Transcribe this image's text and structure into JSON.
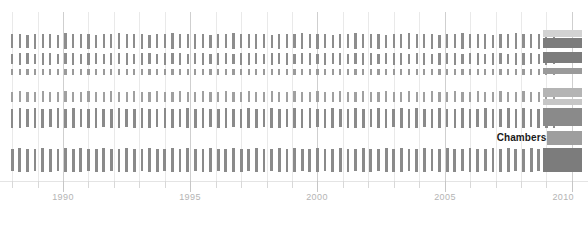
{
  "chart_data": {
    "type": "bar",
    "title": "",
    "subtitle": "",
    "xlabel": "",
    "ylabel": "",
    "xlim": [
      1987.6,
      2010.4
    ],
    "grid": true,
    "legend_position": "none",
    "x_ticks_major": [
      1990,
      1995,
      2000,
      2005,
      2010
    ],
    "x_tick_labels": [
      "1990",
      "1995",
      "2000",
      "2005",
      "2010"
    ],
    "x_ticks_minor": [
      1988,
      1989,
      1991,
      1992,
      1993,
      1994,
      1996,
      1997,
      1998,
      1999,
      2001,
      2002,
      2003,
      2004,
      2006,
      2007,
      2008,
      2009
    ],
    "annotations": [
      {
        "text": "Chambers",
        "x": 2009.0,
        "y_row": "spacer-3",
        "align": "right"
      }
    ],
    "colors": {
      "background": "#ffffff",
      "tick_default": "#8d8d8d",
      "tick_light": "#b9b9b9",
      "tick_dark": "#6f6f6f",
      "gridline": "#e9e9e9",
      "gridline_major": "#cfcfcf",
      "axis_label": "#b4b4b4",
      "annotation": "#1a1a1a",
      "block_light": "#d2d2d2",
      "block_mid": "#9a9a9a",
      "block_dark": "#7c7c7c"
    },
    "series": [
      {
        "name": "row-1",
        "row_index": 0,
        "top": 33,
        "height": 16,
        "bar_color": "#8d8d8d",
        "bar_width": 2.2,
        "x": [
          1988.0,
          1988.3,
          1988.6,
          1988.9,
          1989.2,
          1989.5,
          1989.8,
          1990.1,
          1990.4,
          1990.7,
          1991.0,
          1991.3,
          1991.6,
          1991.9,
          1992.2,
          1992.5,
          1992.8,
          1993.1,
          1993.4,
          1993.7,
          1994.0,
          1994.3,
          1994.6,
          1994.9,
          1995.2,
          1995.5,
          1995.8,
          1996.1,
          1996.4,
          1996.7,
          1997.0,
          1997.3,
          1997.6,
          1997.9,
          1998.2,
          1998.5,
          1998.8,
          1999.1,
          1999.4,
          1999.7,
          2000.0,
          2000.3,
          2000.6,
          2000.9,
          2001.2,
          2001.5,
          2001.8,
          2002.1,
          2002.4,
          2002.7,
          2003.0,
          2003.3,
          2003.6,
          2003.9,
          2004.2,
          2004.5,
          2004.8,
          2005.1,
          2005.4,
          2005.7,
          2006.0,
          2006.3,
          2006.6,
          2006.9,
          2007.2,
          2007.5,
          2007.8,
          2008.1,
          2008.4,
          2008.7,
          2009.0,
          2009.3
        ],
        "values": [
          0.85,
          0.9,
          0.8,
          0.95,
          0.85,
          0.9,
          0.8,
          1.0,
          0.85,
          0.9,
          0.95,
          0.8,
          0.9,
          0.85,
          1.0,
          0.9,
          0.85,
          0.95,
          0.8,
          0.9,
          0.85,
          1.0,
          0.9,
          0.85,
          0.95,
          0.9,
          0.8,
          0.9,
          0.85,
          1.0,
          0.9,
          0.85,
          0.95,
          0.9,
          0.8,
          0.95,
          0.85,
          0.9,
          1.0,
          0.85,
          0.95,
          0.9,
          0.8,
          0.9,
          0.85,
          1.0,
          0.9,
          0.85,
          0.95,
          0.8,
          0.9,
          0.85,
          1.0,
          0.9,
          0.85,
          0.95,
          0.8,
          0.9,
          0.85,
          1.0,
          0.9,
          0.85,
          0.95,
          0.8,
          0.9,
          0.85,
          1.0,
          0.9,
          0.85,
          0.95,
          0.9,
          0.85
        ]
      },
      {
        "name": "row-2",
        "row_index": 1,
        "top": 52,
        "height": 13,
        "bar_color": "#8d8d8d",
        "bar_width": 2.2,
        "x": [
          1988.0,
          1988.3,
          1988.6,
          1988.9,
          1989.2,
          1989.5,
          1989.8,
          1990.1,
          1990.4,
          1990.7,
          1991.0,
          1991.3,
          1991.6,
          1991.9,
          1992.2,
          1992.5,
          1992.8,
          1993.1,
          1993.4,
          1993.7,
          1994.0,
          1994.3,
          1994.6,
          1994.9,
          1995.2,
          1995.5,
          1995.8,
          1996.1,
          1996.4,
          1996.7,
          1997.0,
          1997.3,
          1997.6,
          1997.9,
          1998.2,
          1998.5,
          1998.8,
          1999.1,
          1999.4,
          1999.7,
          2000.0,
          2000.3,
          2000.6,
          2000.9,
          2001.2,
          2001.5,
          2001.8,
          2002.1,
          2002.4,
          2002.7,
          2003.0,
          2003.3,
          2003.6,
          2003.9,
          2004.2,
          2004.5,
          2004.8,
          2005.1,
          2005.4,
          2005.7,
          2006.0,
          2006.3,
          2006.6,
          2006.9,
          2007.2,
          2007.5,
          2007.8,
          2008.1,
          2008.4,
          2008.7,
          2009.0,
          2009.3
        ],
        "values": [
          0.8,
          0.9,
          0.85,
          0.8,
          0.9,
          0.95,
          0.8,
          0.85,
          0.9,
          0.8,
          0.95,
          0.85,
          0.8,
          0.9,
          0.85,
          0.95,
          0.8,
          0.9,
          0.85,
          0.8,
          0.95,
          0.85,
          0.9,
          0.8,
          0.85,
          0.95,
          0.8,
          0.9,
          0.85,
          0.8,
          0.9,
          0.95,
          0.85,
          0.8,
          0.9,
          0.85,
          0.95,
          0.8,
          0.85,
          0.9,
          0.8,
          0.95,
          0.85,
          0.9,
          0.8,
          0.85,
          0.95,
          0.9,
          0.8,
          0.85,
          0.9,
          0.95,
          0.8,
          0.85,
          0.9,
          0.8,
          0.95,
          0.85,
          0.9,
          0.8,
          0.85,
          0.95,
          0.8,
          0.9,
          0.85,
          0.8,
          0.9,
          0.95,
          0.85,
          0.8,
          0.9,
          0.85
        ]
      },
      {
        "name": "row-3",
        "row_index": 2,
        "top": 68,
        "height": 8,
        "bar_color": "#9a9a9a",
        "bar_width": 2.2,
        "x": [
          1988.0,
          1988.3,
          1988.6,
          1988.9,
          1989.2,
          1989.5,
          1989.8,
          1990.1,
          1990.4,
          1990.7,
          1991.0,
          1991.3,
          1991.6,
          1991.9,
          1992.2,
          1992.5,
          1992.8,
          1993.1,
          1993.4,
          1993.7,
          1994.0,
          1994.3,
          1994.6,
          1994.9,
          1995.2,
          1995.5,
          1995.8,
          1996.1,
          1996.4,
          1996.7,
          1997.0,
          1997.3,
          1997.6,
          1997.9,
          1998.2,
          1998.5,
          1998.8,
          1999.1,
          1999.4,
          1999.7,
          2000.0,
          2000.3,
          2000.6,
          2000.9,
          2001.2,
          2001.5,
          2001.8,
          2002.1,
          2002.4,
          2002.7,
          2003.0,
          2003.3,
          2003.6,
          2003.9,
          2004.2,
          2004.5,
          2004.8,
          2005.1,
          2005.4,
          2005.7,
          2006.0,
          2006.3,
          2006.6,
          2006.9,
          2007.2,
          2007.5,
          2007.8,
          2008.1,
          2008.4,
          2008.7,
          2009.0,
          2009.3
        ],
        "values": [
          0.7,
          0.8,
          0.75,
          0.7,
          0.8,
          0.75,
          0.7,
          0.8,
          0.75,
          0.7,
          0.8,
          0.75,
          0.7,
          0.8,
          0.75,
          0.7,
          0.8,
          0.75,
          0.7,
          0.8,
          0.75,
          0.7,
          0.8,
          0.75,
          0.7,
          0.8,
          0.75,
          0.7,
          0.8,
          0.75,
          0.7,
          0.8,
          0.75,
          0.7,
          0.8,
          0.75,
          0.7,
          0.8,
          0.75,
          0.7,
          0.8,
          0.75,
          0.7,
          0.8,
          0.75,
          0.7,
          0.8,
          0.75,
          0.7,
          0.8,
          0.75,
          0.7,
          0.8,
          0.75,
          0.7,
          0.8,
          0.75,
          0.7,
          0.8,
          0.75,
          0.7,
          0.8,
          0.75,
          0.7,
          0.8,
          0.75,
          0.7,
          0.8,
          0.75,
          0.7,
          0.8,
          0.75
        ]
      },
      {
        "name": "row-4",
        "row_index": 3,
        "top": 90,
        "height": 13,
        "bar_color": "#a0a0a0",
        "bar_width": 2.2,
        "x": [
          1988.0,
          1988.3,
          1988.6,
          1988.9,
          1989.2,
          1989.5,
          1989.8,
          1990.1,
          1990.4,
          1990.7,
          1991.0,
          1991.3,
          1991.6,
          1991.9,
          1992.2,
          1992.5,
          1992.8,
          1993.1,
          1993.4,
          1993.7,
          1994.0,
          1994.3,
          1994.6,
          1994.9,
          1995.2,
          1995.5,
          1995.8,
          1996.1,
          1996.4,
          1996.7,
          1997.0,
          1997.3,
          1997.6,
          1997.9,
          1998.2,
          1998.5,
          1998.8,
          1999.1,
          1999.4,
          1999.7,
          2000.0,
          2000.3,
          2000.6,
          2000.9,
          2001.2,
          2001.5,
          2001.8,
          2002.1,
          2002.4,
          2002.7,
          2003.0,
          2003.3,
          2003.6,
          2003.9,
          2004.2,
          2004.5,
          2004.8,
          2005.1,
          2005.4,
          2005.7,
          2006.0,
          2006.3,
          2006.6,
          2006.9,
          2007.2,
          2007.5,
          2007.8,
          2008.1,
          2008.4,
          2008.7,
          2009.0,
          2009.3
        ],
        "values": [
          0.75,
          0.85,
          0.8,
          0.75,
          0.85,
          0.8,
          0.75,
          0.85,
          0.8,
          0.75,
          0.85,
          0.8,
          0.75,
          0.85,
          0.8,
          0.75,
          0.85,
          0.8,
          0.75,
          0.85,
          0.8,
          0.75,
          0.85,
          0.8,
          0.75,
          0.85,
          0.8,
          0.75,
          0.85,
          0.8,
          0.75,
          0.85,
          0.8,
          0.75,
          0.85,
          0.8,
          0.75,
          0.85,
          0.8,
          0.75,
          0.85,
          0.8,
          0.75,
          0.85,
          0.8,
          0.75,
          0.85,
          0.8,
          0.75,
          0.85,
          0.8,
          0.75,
          0.85,
          0.8,
          0.75,
          0.85,
          0.8,
          0.75,
          0.85,
          0.8,
          0.75,
          0.85,
          0.8,
          0.75,
          0.85,
          0.8,
          0.75,
          0.85,
          0.8,
          0.75,
          0.85,
          0.8
        ]
      },
      {
        "name": "row-5",
        "row_index": 4,
        "top": 108,
        "height": 20,
        "bar_color": "#8a8a8a",
        "bar_width": 2.6,
        "x": [
          1988.0,
          1988.3,
          1988.6,
          1988.9,
          1989.2,
          1989.5,
          1989.8,
          1990.1,
          1990.4,
          1990.7,
          1991.0,
          1991.3,
          1991.6,
          1991.9,
          1992.2,
          1992.5,
          1992.8,
          1993.1,
          1993.4,
          1993.7,
          1994.0,
          1994.3,
          1994.6,
          1994.9,
          1995.2,
          1995.5,
          1995.8,
          1996.1,
          1996.4,
          1996.7,
          1997.0,
          1997.3,
          1997.6,
          1997.9,
          1998.2,
          1998.5,
          1998.8,
          1999.1,
          1999.4,
          1999.7,
          2000.0,
          2000.3,
          2000.6,
          2000.9,
          2001.2,
          2001.5,
          2001.8,
          2002.1,
          2002.4,
          2002.7,
          2003.0,
          2003.3,
          2003.6,
          2003.9,
          2004.2,
          2004.5,
          2004.8,
          2005.1,
          2005.4,
          2005.7,
          2006.0,
          2006.3,
          2006.6,
          2006.9,
          2007.2,
          2007.5,
          2007.8,
          2008.1,
          2008.4,
          2008.7,
          2009.0,
          2009.3
        ],
        "values": [
          0.95,
          1.0,
          0.9,
          1.0,
          0.95,
          0.9,
          1.0,
          0.95,
          1.0,
          0.9,
          0.95,
          1.0,
          0.9,
          0.95,
          1.0,
          0.9,
          0.95,
          1.0,
          0.95,
          0.9,
          1.0,
          0.95,
          0.9,
          1.0,
          0.95,
          1.0,
          0.9,
          0.95,
          1.0,
          0.9,
          0.95,
          1.0,
          0.95,
          0.9,
          1.0,
          0.95,
          0.9,
          1.0,
          0.95,
          1.0,
          0.9,
          0.95,
          1.0,
          0.9,
          0.95,
          1.0,
          0.95,
          0.9,
          1.0,
          0.95,
          0.9,
          1.0,
          0.95,
          1.0,
          0.9,
          0.95,
          1.0,
          0.9,
          0.95,
          1.0,
          0.95,
          0.9,
          1.0,
          0.95,
          0.9,
          1.0,
          0.95,
          1.0,
          0.9,
          0.95,
          1.0,
          0.95
        ]
      },
      {
        "name": "row-6",
        "row_index": 5,
        "top": 148,
        "height": 24,
        "bar_color": "#8a8a8a",
        "bar_width": 2.8,
        "x": [
          1988.0,
          1988.3,
          1988.6,
          1988.9,
          1989.2,
          1989.5,
          1989.8,
          1990.1,
          1990.4,
          1990.7,
          1991.0,
          1991.3,
          1991.6,
          1991.9,
          1992.2,
          1992.5,
          1992.8,
          1993.1,
          1993.4,
          1993.7,
          1994.0,
          1994.3,
          1994.6,
          1994.9,
          1995.2,
          1995.5,
          1995.8,
          1996.1,
          1996.4,
          1996.7,
          1997.0,
          1997.3,
          1997.6,
          1997.9,
          1998.2,
          1998.5,
          1998.8,
          1999.1,
          1999.4,
          1999.7,
          2000.0,
          2000.3,
          2000.6,
          2000.9,
          2001.2,
          2001.5,
          2001.8,
          2002.1,
          2002.4,
          2002.7,
          2003.0,
          2003.3,
          2003.6,
          2003.9,
          2004.2,
          2004.5,
          2004.8,
          2005.1,
          2005.4,
          2005.7,
          2006.0,
          2006.3,
          2006.6,
          2006.9,
          2007.2,
          2007.5,
          2007.8,
          2008.1,
          2008.4,
          2008.7,
          2009.0,
          2009.3
        ],
        "values": [
          0.9,
          1.0,
          0.95,
          0.9,
          1.0,
          0.95,
          0.9,
          1.0,
          0.95,
          1.0,
          0.9,
          0.95,
          1.0,
          0.9,
          0.95,
          1.0,
          0.95,
          0.9,
          1.0,
          0.95,
          0.9,
          1.0,
          0.95,
          1.0,
          0.9,
          0.95,
          1.0,
          0.9,
          0.95,
          1.0,
          0.95,
          0.9,
          1.0,
          0.95,
          0.9,
          1.0,
          0.95,
          1.0,
          0.9,
          0.95,
          1.0,
          0.9,
          0.95,
          1.0,
          0.95,
          0.9,
          1.0,
          0.95,
          0.9,
          1.0,
          0.95,
          1.0,
          0.9,
          0.95,
          1.0,
          0.9,
          0.95,
          1.0,
          0.95,
          0.9,
          1.0,
          0.95,
          0.9,
          1.0,
          0.95,
          1.0,
          0.9,
          0.95,
          1.0,
          0.9,
          0.95,
          1.0
        ]
      }
    ],
    "right_blocks": [
      {
        "name": "block-row-1-top",
        "top": 30,
        "height": 7,
        "left": 543,
        "width": 39,
        "color": "#d2d2d2"
      },
      {
        "name": "block-row-1",
        "top": 38,
        "height": 10,
        "left": 543,
        "width": 39,
        "color": "#7c7c7c"
      },
      {
        "name": "block-row-2",
        "top": 52,
        "height": 11,
        "left": 543,
        "width": 39,
        "color": "#7c7c7c"
      },
      {
        "name": "block-row-3",
        "top": 68,
        "height": 6,
        "left": 543,
        "width": 39,
        "color": "#9a9a9a"
      },
      {
        "name": "block-row-4-top",
        "top": 88,
        "height": 9,
        "left": 543,
        "width": 39,
        "color": "#b4b4b4"
      },
      {
        "name": "block-row-4",
        "top": 99,
        "height": 6,
        "left": 543,
        "width": 39,
        "color": "#c6c6c6"
      },
      {
        "name": "block-row-5",
        "top": 108,
        "height": 18,
        "left": 543,
        "width": 39,
        "color": "#8a8a8a"
      },
      {
        "name": "block-annot",
        "top": 131,
        "height": 14,
        "left": 547,
        "width": 35,
        "color": "#9e9e9e"
      },
      {
        "name": "block-row-6",
        "top": 148,
        "height": 24,
        "left": 543,
        "width": 39,
        "color": "#7c7c7c"
      }
    ],
    "axis_y": 181
  }
}
